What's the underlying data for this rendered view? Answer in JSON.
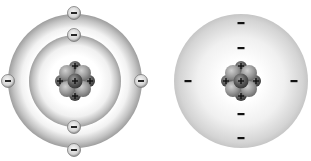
{
  "diagram": {
    "models": [
      {
        "name": "bohr-model",
        "center": [
          75,
          81
        ],
        "shells": [
          {
            "radius": 46,
            "electrons": [
              [
                74,
                35
              ],
              [
                74,
                127
              ]
            ]
          },
          {
            "radius": 67,
            "electrons": [
              [
                74,
                13
              ],
              [
                74,
                150
              ],
              [
                7,
                81
              ],
              [
                141,
                81
              ]
            ]
          }
        ],
        "electron_symbol": "−",
        "proton_symbol": "+"
      },
      {
        "name": "electron-cloud-model",
        "center": [
          241,
          81
        ],
        "cloud_radius": 67,
        "electrons": [
          [
            241,
            23
          ],
          [
            241,
            48
          ],
          [
            241,
            114
          ],
          [
            241,
            138
          ],
          [
            188,
            81
          ],
          [
            294,
            81
          ]
        ],
        "electron_symbol": "−",
        "proton_symbol": "+"
      }
    ],
    "nucleus": {
      "protons": 4,
      "neutrons": 5,
      "proton_color": "#5a5a5a",
      "neutron_color": "#9a9a9a"
    },
    "colors": {
      "shell_dark": "#9c9c9c",
      "shell_light": "#ffffff",
      "cloud_edge": "#c8c8c8",
      "electron_fill": "#d8d8d8",
      "symbol": "#111111"
    }
  }
}
